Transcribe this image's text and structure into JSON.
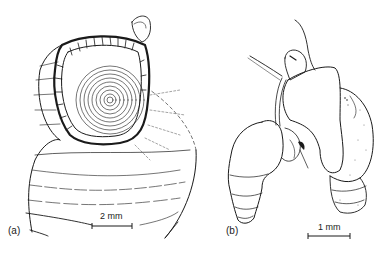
{
  "figure": {
    "panels": [
      {
        "id": "a",
        "label": "(a)",
        "subject": "snail-shell-with-operculum",
        "scale_bar": {
          "text": "2 mm"
        }
      },
      {
        "id": "b",
        "label": "(b)",
        "subject": "pair-of-snails-with-extended-bodies",
        "scale_bar": {
          "text": "1 mm"
        }
      }
    ],
    "colors": {
      "ink": "#1a1a1a",
      "background": "#ffffff"
    }
  }
}
